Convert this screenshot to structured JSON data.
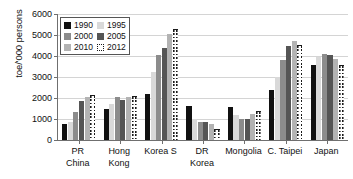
{
  "chart_data": {
    "type": "bar",
    "title": "",
    "xlabel": "",
    "ylabel": "toe/'000 persons",
    "ylim": [
      0,
      6000
    ],
    "ytick_labels": [
      "6000",
      "5000",
      "4000",
      "3000",
      "2000",
      "1000",
      "0"
    ],
    "ytick_values": [
      6000,
      5000,
      4000,
      3000,
      2000,
      1000,
      0
    ],
    "grid": true,
    "legend_position": "top-left",
    "categories": [
      "PR China",
      "Hong Kong",
      "Korea S",
      "DR Korea",
      "Mongolia",
      "C. Taipei",
      "Japan"
    ],
    "category_lines": [
      [
        "PR",
        "China"
      ],
      [
        "Hong",
        "Kong"
      ],
      [
        "Korea S",
        ""
      ],
      [
        "DR",
        "Korea"
      ],
      [
        "Mongolia",
        ""
      ],
      [
        "C. Taipei",
        ""
      ],
      [
        "Japan",
        ""
      ]
    ],
    "series": [
      {
        "name": "1990",
        "color": "#111111",
        "values": [
          750,
          1500,
          2170,
          1640,
          1570,
          2370,
          3550
        ]
      },
      {
        "name": "1995",
        "color": "#d9d9d9",
        "values": [
          880,
          1730,
          3240,
          1000,
          1200,
          2990,
          3940
        ]
      },
      {
        "name": "2000",
        "color": "#8c8c8c",
        "values": [
          1350,
          2050,
          4030,
          880,
          980,
          3830,
          4080
        ]
      },
      {
        "name": "2005",
        "color": "#555555",
        "values": [
          1880,
          1890,
          4380,
          880,
          1020,
          4490,
          4070
        ]
      },
      {
        "name": "2010",
        "color": "#b3b3b3",
        "values": [
          2070,
          2040,
          5060,
          760,
          1250,
          4720,
          3880
        ]
      },
      {
        "name": "2012",
        "color": "#ffffff",
        "values": [
          2130,
          2080,
          5300,
          540,
          1390,
          4520,
          3550
        ]
      }
    ]
  },
  "legend": {
    "items": [
      {
        "label": "1990",
        "key": "s1990"
      },
      {
        "label": "1995",
        "key": "s1995"
      },
      {
        "label": "2000",
        "key": "s2000"
      },
      {
        "label": "2005",
        "key": "s2005"
      },
      {
        "label": "2010",
        "key": "s2010"
      },
      {
        "label": "2012",
        "key": "s2012"
      }
    ]
  }
}
